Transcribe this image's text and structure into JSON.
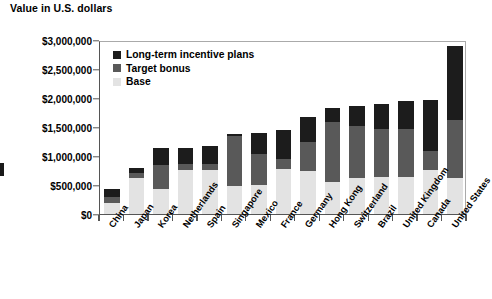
{
  "axis_title": "Value in U.S. dollars",
  "legend": {
    "position": "top-left-inside",
    "items": [
      {
        "label": "Long-term incentive plans",
        "color": "#1c1c1c",
        "key": "ltip"
      },
      {
        "label": "Target bonus",
        "color": "#595959",
        "key": "bonus"
      },
      {
        "label": "Base",
        "color": "#e3e3e3",
        "key": "base"
      }
    ]
  },
  "y_axis": {
    "ticks": [
      "$0",
      "$500,000",
      "$1,000,000",
      "$1,500,000",
      "$2,000,000",
      "$2,500,000",
      "$3,000,000"
    ],
    "tick_values": [
      0,
      500000,
      1000000,
      1500000,
      2000000,
      2500000,
      3000000
    ],
    "min": 0,
    "max": 3000000
  },
  "chart_data": {
    "type": "bar",
    "subtype": "stacked-bar",
    "title": "",
    "subtitle": "",
    "xlabel": "",
    "ylabel": "Value in U.S. dollars",
    "ylim": [
      0,
      3000000
    ],
    "grid": false,
    "legend_position": "top-left-inside",
    "categories": [
      "China",
      "Japan",
      "Korea",
      "Netherlands",
      "Spain",
      "Singapore",
      "Mexico",
      "France",
      "Germany",
      "Hong Kong",
      "Switzerland",
      "Brazil",
      "United Kingdom",
      "Canada",
      "United States"
    ],
    "series": [
      {
        "name": "Base",
        "color": "#e3e3e3",
        "values": [
          190000,
          620000,
          430000,
          760000,
          760000,
          480000,
          500000,
          780000,
          750000,
          560000,
          620000,
          630000,
          640000,
          760000,
          620000
        ]
      },
      {
        "name": "Target bonus",
        "color": "#595959",
        "values": [
          95000,
          85000,
          420000,
          110000,
          95000,
          870000,
          540000,
          170000,
          500000,
          1020000,
          900000,
          830000,
          820000,
          320000,
          1000000
        ]
      },
      {
        "name": "Long-term incentive plans",
        "color": "#1c1c1c",
        "values": [
          150000,
          95000,
          280000,
          265000,
          325000,
          30000,
          360000,
          495000,
          430000,
          240000,
          340000,
          430000,
          490000,
          890000,
          1270000
        ]
      }
    ],
    "totals": [
      435000,
      800000,
      1130000,
      1135000,
      1180000,
      1380000,
      1400000,
      1445000,
      1680000,
      1820000,
      1860000,
      1890000,
      1950000,
      1970000,
      2890000
    ]
  }
}
